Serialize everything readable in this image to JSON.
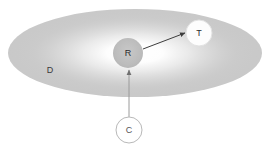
{
  "diagram": {
    "canvas": {
      "width": 268,
      "height": 152,
      "background": "#ffffff"
    },
    "region": {
      "name": "domain-ellipse",
      "label": "D",
      "label_x": 50,
      "label_y": 70,
      "cx": 135,
      "cy": 53,
      "rx": 127,
      "ry": 44,
      "fill_edge": "#c9c9c9",
      "fill_center": "#ffffff"
    },
    "nodes": [
      {
        "id": "R",
        "label": "R",
        "name": "node-robot",
        "cx": 128,
        "cy": 53,
        "r": 15,
        "fill": "#bdbdbd",
        "stroke": "none",
        "text_color": "#2b2b2b"
      },
      {
        "id": "T",
        "label": "T",
        "name": "node-target",
        "cx": 199,
        "cy": 33,
        "r": 13,
        "fill": "#fdfdfd",
        "stroke": "#e2e2e2",
        "text_color": "#2b2b2b"
      },
      {
        "id": "C",
        "label": "C",
        "name": "node-controller",
        "cx": 129,
        "cy": 130,
        "r": 13,
        "fill": "#ffffff",
        "stroke": "#b9b9b9",
        "text_color": "#555555"
      }
    ],
    "arrows": [
      {
        "name": "arrow-robot-to-target",
        "from": "R",
        "to": "T",
        "x1": 143,
        "y1": 49,
        "x2": 185,
        "y2": 33,
        "color": "#3d3d3d",
        "width": 1
      },
      {
        "name": "arrow-controller-to-robot",
        "from": "C",
        "to": "R",
        "x1": 129,
        "y1": 117,
        "x2": 129,
        "y2": 70,
        "color": "#9a9a9a",
        "width": 1
      }
    ]
  }
}
